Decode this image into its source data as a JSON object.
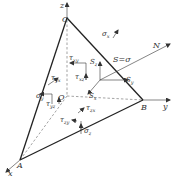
{
  "diagram": {
    "vertices": {
      "C": "C",
      "O": "O",
      "A": "A",
      "B": "B"
    },
    "axes": {
      "x": "x",
      "y": "y",
      "z": "z",
      "normal": "N"
    },
    "resultant": {
      "S_eq": "S=σ",
      "Sx": "S",
      "Sx_sub": "x",
      "Sy": "S",
      "Sy_sub": "y",
      "Sz": "S",
      "Sz_sub": "z"
    },
    "stresses": {
      "sigma_x": {
        "base": "σ",
        "sub": "x"
      },
      "sigma_y": {
        "base": "σ",
        "sub": "y"
      },
      "sigma_z": {
        "base": "σ",
        "sub": "z"
      },
      "tau_xy": {
        "base": "τ",
        "sub": "xy"
      },
      "tau_xz": {
        "base": "τ",
        "sub": "xz"
      },
      "tau_yx": {
        "base": "τ",
        "sub": "yx"
      },
      "tau_yz": {
        "base": "τ",
        "sub": "yz"
      },
      "tau_zx": {
        "base": "τ",
        "sub": "zx"
      },
      "tau_zy": {
        "base": "τ",
        "sub": "zy"
      }
    },
    "colors": {
      "line": "#222222",
      "dashed": "#555555",
      "text": "#333333",
      "background": "#ffffff"
    }
  }
}
